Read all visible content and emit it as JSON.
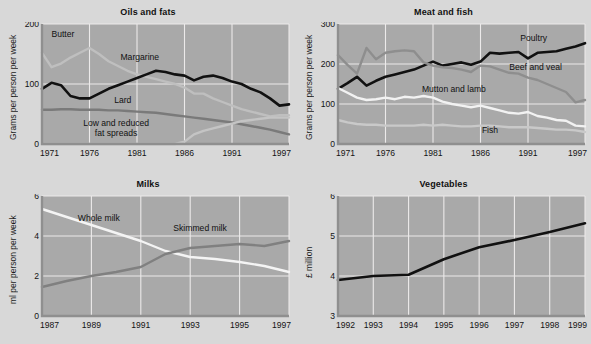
{
  "page": {
    "background": "#d8d8d8",
    "plot_background": "#a9a9a9",
    "gridline_color": "#ececec",
    "axis_color": "#8f8f8f"
  },
  "charts": [
    {
      "id": "oils-and-fats",
      "title": "Oils and fats",
      "type": "line",
      "ylabel": "Grams per person per week",
      "xlabel": "",
      "ylim": [
        0,
        200
      ],
      "yticks": [
        0,
        100,
        200
      ],
      "ytick_labels": [
        "0",
        "100",
        "200"
      ],
      "xlim": [
        1971,
        1997
      ],
      "xticks": [
        1971,
        1976,
        1981,
        1986,
        1991,
        1997
      ],
      "xtick_labels": [
        "1971",
        "1976",
        "1981",
        "1986",
        "1991",
        "1997"
      ],
      "grid": true,
      "legend_position": "inline-annotations",
      "x": [
        1971,
        1972,
        1973,
        1974,
        1975,
        1976,
        1977,
        1978,
        1979,
        1980,
        1981,
        1982,
        1983,
        1984,
        1985,
        1986,
        1987,
        1988,
        1989,
        1990,
        1991,
        1992,
        1993,
        1994,
        1995,
        1996,
        1997
      ],
      "series": [
        {
          "name": "Butter",
          "color": "#bfbfbf",
          "label_x": 1973.2,
          "label_y": 178,
          "values": [
            152,
            128,
            134,
            144,
            152,
            160,
            150,
            138,
            130,
            122,
            116,
            112,
            108,
            104,
            100,
            94,
            84,
            84,
            76,
            70,
            64,
            58,
            54,
            50,
            46,
            48,
            48,
            56,
            62,
            66,
            70,
            74,
            76
          ]
        },
        {
          "name": "Margarine",
          "color": "#111111",
          "label_x": 1981.3,
          "label_y": 140,
          "values": [
            92,
            102,
            98,
            80,
            76,
            76,
            84,
            92,
            98,
            104,
            110,
            116,
            122,
            120,
            116,
            114,
            106,
            112,
            114,
            110,
            104,
            100,
            92,
            86,
            76,
            64,
            66,
            60,
            52,
            46,
            40,
            34,
            28
          ]
        },
        {
          "name": "Lard",
          "color": "#7a7a7a",
          "label_x": 1979.5,
          "label_y": 68,
          "values": [
            57,
            57,
            58,
            58,
            57,
            57,
            57,
            56,
            56,
            55,
            54,
            53,
            52,
            50,
            48,
            46,
            44,
            42,
            40,
            38,
            36,
            33,
            30,
            27,
            24,
            20,
            16,
            14,
            12,
            11,
            10,
            10,
            10
          ]
        },
        {
          "name": "Low and reduced fat spreads",
          "color": "#c4c4c4",
          "label_x": 1978.8,
          "label_y": 30,
          "values": [
            0,
            0,
            0,
            0,
            0,
            0,
            0,
            0,
            0,
            0,
            0,
            0,
            0,
            0,
            0,
            4,
            16,
            22,
            26,
            30,
            34,
            38,
            40,
            42,
            44,
            44,
            44,
            46,
            46,
            46,
            46,
            46,
            46
          ]
        }
      ]
    },
    {
      "id": "meat-and-fish",
      "title": "Meat and fish",
      "type": "line",
      "ylabel": "Grams per person per week",
      "xlabel": "",
      "ylim": [
        0,
        300
      ],
      "yticks": [
        0,
        100,
        200,
        300
      ],
      "ytick_labels": [
        "0",
        "100",
        "200",
        "300"
      ],
      "xlim": [
        1971,
        1997
      ],
      "xticks": [
        1971,
        1976,
        1981,
        1986,
        1991,
        1997
      ],
      "xtick_labels": [
        "1971",
        "1976",
        "1981",
        "1986",
        "1991",
        "1997"
      ],
      "grid": true,
      "legend_position": "inline-annotations",
      "x": [
        1971,
        1972,
        1973,
        1974,
        1975,
        1976,
        1977,
        1978,
        1979,
        1980,
        1981,
        1982,
        1983,
        1984,
        1985,
        1986,
        1987,
        1988,
        1989,
        1990,
        1991,
        1992,
        1993,
        1994,
        1995,
        1996,
        1997
      ],
      "series": [
        {
          "name": "Poultry",
          "color": "#111111",
          "label_x": 1991.6,
          "label_y": 258,
          "values": [
            138,
            152,
            168,
            146,
            158,
            168,
            174,
            180,
            186,
            196,
            206,
            196,
            200,
            204,
            198,
            206,
            228,
            226,
            228,
            230,
            214,
            228,
            230,
            232,
            238,
            244,
            252
          ]
        },
        {
          "name": "Beef and veal",
          "color": "#8e8e8e",
          "label_x": 1991.8,
          "label_y": 185,
          "values": [
            222,
            198,
            176,
            240,
            212,
            228,
            232,
            234,
            232,
            204,
            196,
            192,
            190,
            186,
            180,
            196,
            194,
            186,
            178,
            176,
            166,
            160,
            150,
            140,
            130,
            104,
            110
          ]
        },
        {
          "name": "Mutton and lamb",
          "color": "#f2f2f2",
          "label_x": 1983.2,
          "label_y": 130,
          "values": [
            140,
            128,
            116,
            110,
            112,
            116,
            112,
            118,
            116,
            120,
            116,
            106,
            100,
            96,
            92,
            96,
            90,
            84,
            78,
            76,
            80,
            70,
            66,
            60,
            58,
            46,
            44
          ]
        },
        {
          "name": "Fish",
          "color": "#c9c9c9",
          "label_x": 1987.0,
          "label_y": 28,
          "values": [
            60,
            54,
            50,
            48,
            48,
            46,
            46,
            46,
            46,
            48,
            46,
            48,
            46,
            44,
            44,
            46,
            46,
            44,
            42,
            42,
            42,
            40,
            38,
            36,
            36,
            34,
            30
          ]
        }
      ]
    },
    {
      "id": "milks",
      "title": "Milks",
      "type": "line",
      "ylabel": "ml per person per week",
      "xlabel": "",
      "ylim": [
        0,
        6
      ],
      "yticks": [
        0,
        2,
        4,
        6
      ],
      "ytick_labels": [
        "0",
        "2",
        "4",
        "6"
      ],
      "xlim": [
        1987,
        1997
      ],
      "xticks": [
        1987,
        1989,
        1991,
        1993,
        1995,
        1997
      ],
      "xtick_labels": [
        "1987",
        "1989",
        "1991",
        "1993",
        "1995",
        "1997"
      ],
      "grid": true,
      "legend_position": "inline-annotations",
      "x": [
        1987,
        1988,
        1989,
        1990,
        1991,
        1992,
        1993,
        1994,
        1995,
        1996,
        1997
      ],
      "series": [
        {
          "name": "Whole milk",
          "color": "#f4f4f4",
          "label_x": 1989.3,
          "label_y": 4.75,
          "values": [
            5.35,
            4.95,
            4.55,
            4.15,
            3.75,
            3.25,
            2.95,
            2.85,
            2.7,
            2.5,
            2.2
          ]
        },
        {
          "name": "Skimmed milk",
          "color": "#808080",
          "label_x": 1993.4,
          "label_y": 4.25,
          "values": [
            1.45,
            1.75,
            2.0,
            2.2,
            2.45,
            3.1,
            3.4,
            3.5,
            3.6,
            3.5,
            3.75
          ]
        }
      ]
    },
    {
      "id": "vegetables",
      "title": "Vegetables",
      "type": "line",
      "ylabel": "£ million",
      "xlabel": "",
      "ylim": [
        3,
        6
      ],
      "yticks": [
        3,
        4,
        5,
        6
      ],
      "ytick_labels": [
        "3",
        "4",
        "5",
        "6"
      ],
      "xlim": [
        1992,
        1999
      ],
      "xticks": [
        1992,
        1993,
        1994,
        1995,
        1996,
        1997,
        1998,
        1999
      ],
      "xtick_labels": [
        "1992",
        "1993",
        "1994",
        "1995",
        "1996",
        "1997",
        "1998",
        "1999"
      ],
      "grid": true,
      "legend_position": "none",
      "x": [
        1992,
        1993,
        1994,
        1995,
        1996,
        1997,
        1998,
        1999
      ],
      "series": [
        {
          "name": "Vegetables",
          "color": "#111111",
          "label_x": null,
          "label_y": null,
          "values": [
            3.9,
            4.0,
            4.03,
            4.42,
            4.72,
            4.9,
            5.1,
            5.32
          ]
        }
      ]
    }
  ]
}
